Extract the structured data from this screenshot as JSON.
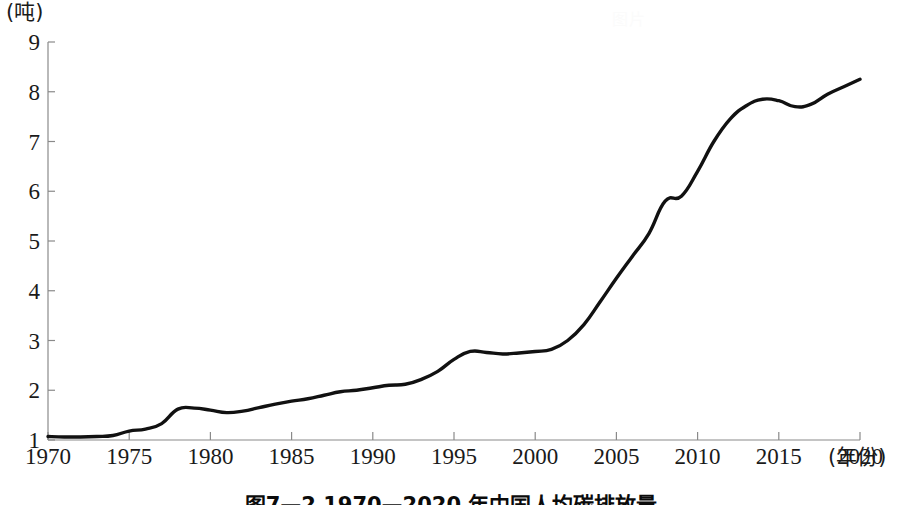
{
  "figure": {
    "caption": "图7—2  1970—2020 年中国人均碳排放量",
    "watermark": "图片"
  },
  "axes": {
    "y_unit": "(吨)",
    "x_unit": "(年份)",
    "y_ticks": [
      "1",
      "2",
      "3",
      "4",
      "5",
      "6",
      "7",
      "8",
      "9"
    ],
    "x_ticks": [
      "1970",
      "1975",
      "1980",
      "1985",
      "1990",
      "1995",
      "2000",
      "2005",
      "2010",
      "2015",
      "2020"
    ]
  },
  "style": {
    "line_color": "#111111",
    "axis_color": "#8a8a8a",
    "background": "#ffffff"
  },
  "chart_data": {
    "type": "line",
    "title": "图7—2  1970—2020 年中国人均碳排放量",
    "xlabel": "(年份)",
    "ylabel": "(吨)",
    "xlim": [
      1970,
      2020
    ],
    "ylim": [
      1,
      9
    ],
    "grid": false,
    "legend": "none",
    "x": [
      1970,
      1971,
      1972,
      1973,
      1974,
      1975,
      1976,
      1977,
      1978,
      1979,
      1980,
      1981,
      1982,
      1983,
      1984,
      1985,
      1986,
      1987,
      1988,
      1989,
      1990,
      1991,
      1992,
      1993,
      1994,
      1995,
      1996,
      1997,
      1998,
      1999,
      2000,
      2001,
      2002,
      2003,
      2004,
      2005,
      2006,
      2007,
      2008,
      2009,
      2010,
      2011,
      2012,
      2013,
      2014,
      2015,
      2016,
      2017,
      2018,
      2019,
      2020
    ],
    "series": [
      {
        "name": "中国人均碳排放量",
        "values": [
          1.07,
          1.06,
          1.06,
          1.07,
          1.09,
          1.18,
          1.22,
          1.33,
          1.62,
          1.64,
          1.6,
          1.55,
          1.58,
          1.65,
          1.72,
          1.78,
          1.83,
          1.9,
          1.97,
          2.0,
          2.05,
          2.1,
          2.12,
          2.22,
          2.38,
          2.62,
          2.78,
          2.76,
          2.73,
          2.75,
          2.78,
          2.82,
          3.0,
          3.32,
          3.78,
          4.25,
          4.7,
          5.15,
          5.8,
          5.9,
          6.4,
          7.0,
          7.45,
          7.72,
          7.85,
          7.82,
          7.7,
          7.75,
          7.95,
          8.1,
          8.25
        ]
      }
    ]
  }
}
